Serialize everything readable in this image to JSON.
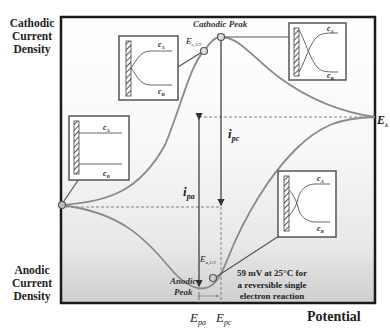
{
  "diagram": {
    "axes": {
      "y_top_label": [
        "Cathodic",
        "Current",
        "Density"
      ],
      "y_bottom_label": [
        "Anodic",
        "Current",
        "Density"
      ],
      "x_label": "Potential"
    },
    "annotations": {
      "cathodic_peak": "Cathodic Peak",
      "anodic_peak": [
        "Anodic",
        "Peak"
      ],
      "e_c_half": "E",
      "e_c_half_sub": "c,1/2",
      "e_a_half": "E",
      "e_a_half_sub": "a,1/2",
      "e_lambda": "E",
      "e_lambda_sub": "λ",
      "i_pc": "i",
      "i_pc_sub": "pc",
      "i_pa": "i",
      "i_pa_sub": "pa",
      "e_pa": "E",
      "e_pa_sub": "pa",
      "e_pc": "E",
      "e_pc_sub": "pc",
      "separation_note": [
        "59 mV at 25°C for",
        "a reversible single",
        "electron reaction"
      ]
    },
    "insets": [
      {
        "position": "start",
        "c_a": "c",
        "c_a_sub": "A",
        "c_b": "c",
        "c_b_sub": "B",
        "profile": "flat"
      },
      {
        "position": "e_c_half",
        "c_a": "c",
        "c_a_sub": "A",
        "c_b": "c",
        "c_b_sub": "B",
        "profile": "diverging"
      },
      {
        "position": "cathodic_peak",
        "c_a": "c",
        "c_a_sub": "A",
        "c_b": "c",
        "c_b_sub": "B",
        "profile": "crossed"
      },
      {
        "position": "e_a_half",
        "c_a": "c",
        "c_a_sub": "A",
        "c_b": "c",
        "c_b_sub": "B",
        "profile": "double-crossed"
      }
    ],
    "colors": {
      "curve": "#8a8a8a",
      "frame": "#1a1a1a",
      "inset_border": "#555555",
      "text": "#222222",
      "bg_bottom": "#d6d6d6"
    }
  }
}
